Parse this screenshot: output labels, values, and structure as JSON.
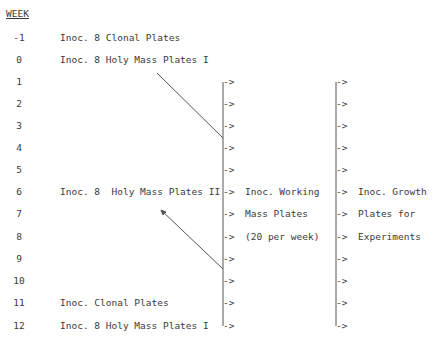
{
  "header": {
    "week_label": "WEEK"
  },
  "rows": [
    {
      "week": "-1",
      "action": "Inoc. 8 Clonal Plates"
    },
    {
      "week": "0",
      "action": "Inoc. 8 Holy Mass Plates I"
    },
    {
      "week": "1",
      "action": ""
    },
    {
      "week": "2",
      "action": ""
    },
    {
      "week": "3",
      "action": ""
    },
    {
      "week": "4",
      "action": ""
    },
    {
      "week": "5",
      "action": ""
    },
    {
      "week": "6",
      "action": "Inoc. 8  Holy Mass Plates II"
    },
    {
      "week": "7",
      "action": ""
    },
    {
      "week": "8",
      "action": ""
    },
    {
      "week": "9",
      "action": ""
    },
    {
      "week": "10",
      "action": ""
    },
    {
      "week": "11",
      "action": "Inoc. Clonal Plates"
    },
    {
      "week": "12",
      "action": "Inoc. 8 Holy Mass Plates I"
    }
  ],
  "column2": {
    "lines": [
      "Inoc. Working",
      "Mass Plates",
      "(20 per week)"
    ]
  },
  "column3": {
    "lines": [
      "Inoc. Growth",
      "Plates for",
      "Experiments"
    ]
  },
  "arrow_glyph": "->",
  "colors": {
    "ink": "#3a3a3a",
    "line": "#555555"
  }
}
